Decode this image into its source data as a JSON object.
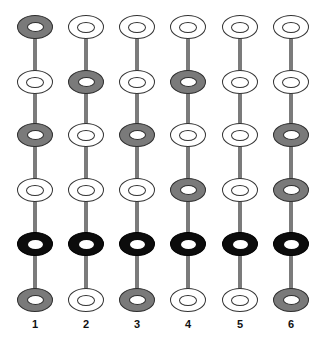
{
  "diagram": {
    "colors": {
      "gray": "#7a7a7a",
      "white": "#ffffff",
      "black": "#0c0c0c",
      "line": "#7b7b7b",
      "outline": "#333333"
    },
    "columns": [
      {
        "label": "1",
        "rings": [
          "gray",
          "white",
          "gray",
          "white",
          "black",
          "gray"
        ]
      },
      {
        "label": "2",
        "rings": [
          "white",
          "gray",
          "white",
          "white",
          "black",
          "white"
        ]
      },
      {
        "label": "3",
        "rings": [
          "white",
          "white",
          "gray",
          "white",
          "black",
          "gray"
        ]
      },
      {
        "label": "4",
        "rings": [
          "white",
          "gray",
          "white",
          "gray",
          "black",
          "white"
        ]
      },
      {
        "label": "5",
        "rings": [
          "white",
          "white",
          "white",
          "white",
          "black",
          "white"
        ]
      },
      {
        "label": "6",
        "rings": [
          "white",
          "white",
          "gray",
          "gray",
          "black",
          "gray"
        ]
      }
    ]
  }
}
